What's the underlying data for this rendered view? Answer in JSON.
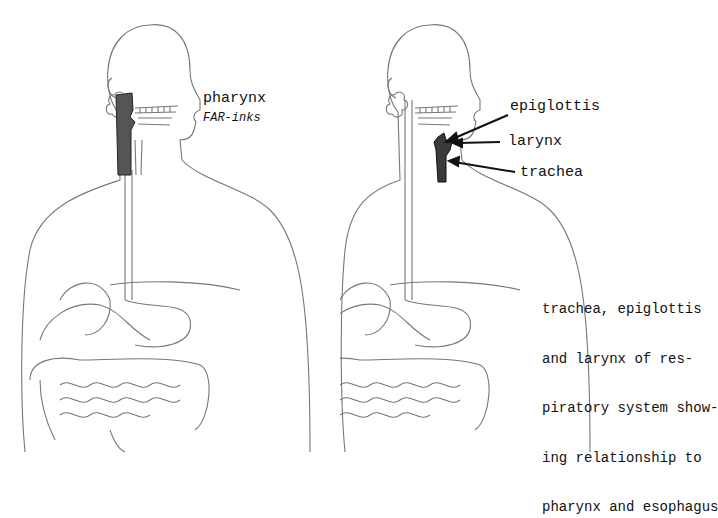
{
  "left_figure": {
    "label": "pharynx",
    "pronunciation": "FAR-inks",
    "highlight_color": "#555555"
  },
  "right_figure": {
    "labels": {
      "epiglottis": "epiglottis",
      "larynx": "larynx",
      "trachea": "trachea"
    },
    "highlight_color": "#3a3a3a",
    "caption_lines": [
      "trachea, epiglottis",
      "and larynx of res-",
      "piratory system show-",
      "ing relationship to",
      "pharynx and esophagus"
    ]
  }
}
